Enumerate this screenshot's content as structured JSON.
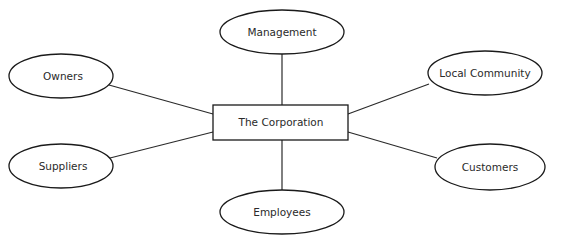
{
  "diagram": {
    "type": "stakeholder-map",
    "center": {
      "id": "corporation",
      "label": "The Corporation",
      "shape": "rectangle"
    },
    "nodes": [
      {
        "id": "management",
        "label": "Management",
        "shape": "ellipse"
      },
      {
        "id": "owners",
        "label": "Owners",
        "shape": "ellipse"
      },
      {
        "id": "local-community",
        "label": "Local Community",
        "shape": "ellipse"
      },
      {
        "id": "suppliers",
        "label": "Suppliers",
        "shape": "ellipse"
      },
      {
        "id": "customers",
        "label": "Customers",
        "shape": "ellipse"
      },
      {
        "id": "employees",
        "label": "Employees",
        "shape": "ellipse"
      }
    ],
    "edges": [
      {
        "from": "corporation",
        "to": "management"
      },
      {
        "from": "corporation",
        "to": "owners"
      },
      {
        "from": "corporation",
        "to": "local-community"
      },
      {
        "from": "corporation",
        "to": "suppliers"
      },
      {
        "from": "corporation",
        "to": "customers"
      },
      {
        "from": "corporation",
        "to": "employees"
      }
    ],
    "colors": {
      "stroke": "#1a1a1a",
      "text": "#2a2a2a",
      "fill": "#ffffff"
    }
  }
}
